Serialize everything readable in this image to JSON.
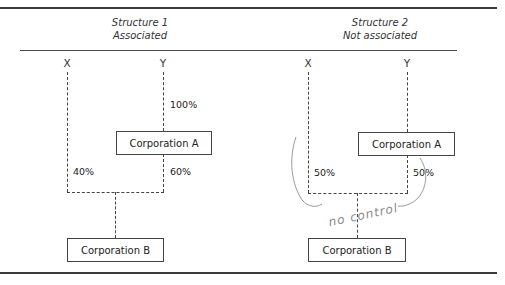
{
  "structures": [
    {
      "title": "Structure 1",
      "subtitle": "Associated",
      "parties": {
        "x": "X",
        "y": "Y"
      },
      "corp_a": "Corporation A",
      "corp_b": "Corporation B",
      "y_to_a_pct": "100%",
      "x_to_b_pct": "40%",
      "a_to_b_pct": "60%"
    },
    {
      "title": "Structure 2",
      "subtitle": "Not associated",
      "parties": {
        "x": "X",
        "y": "Y"
      },
      "corp_a": "Corporation A",
      "corp_b": "Corporation B",
      "y_to_a_pct": "",
      "x_to_b_pct": "50%",
      "a_to_b_pct": "50%",
      "annotation": "no control"
    }
  ]
}
